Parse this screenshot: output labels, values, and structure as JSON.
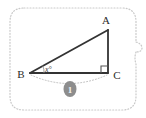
{
  "figure": {
    "kind": "right-triangle-diagram",
    "frame": {
      "style": "dotted-rounded-rectangle",
      "color": "#c9c9c9",
      "has_right_side_gap": true
    },
    "background_color": "#ffffff",
    "line_color": "#333333",
    "label_color": "#2b2b2b"
  },
  "vertices": {
    "a": {
      "label": "A",
      "x": 108,
      "y": 30
    },
    "b": {
      "label": "B",
      "x": 30,
      "y": 73
    },
    "c": {
      "label": "C",
      "x": 108,
      "y": 73
    }
  },
  "angle": {
    "at_vertex": "B",
    "label": "x°",
    "value_text": "x",
    "degree_symbol": "°",
    "arm_marker": "thin-arc"
  },
  "right_angle": {
    "at_vertex": "C",
    "marker": "square",
    "size_px": 7
  },
  "measure_arc": {
    "from": "B",
    "to": "C",
    "style": "dotted",
    "color": "#bdbdbd",
    "badge": {
      "shape": "ellipse",
      "fill": "#8d8d8d",
      "label": "1"
    }
  },
  "icons": {
    "right-angle-icon": "square-corner",
    "arc-icon": "dotted-arc",
    "badge-icon": "filled-ellipse"
  }
}
